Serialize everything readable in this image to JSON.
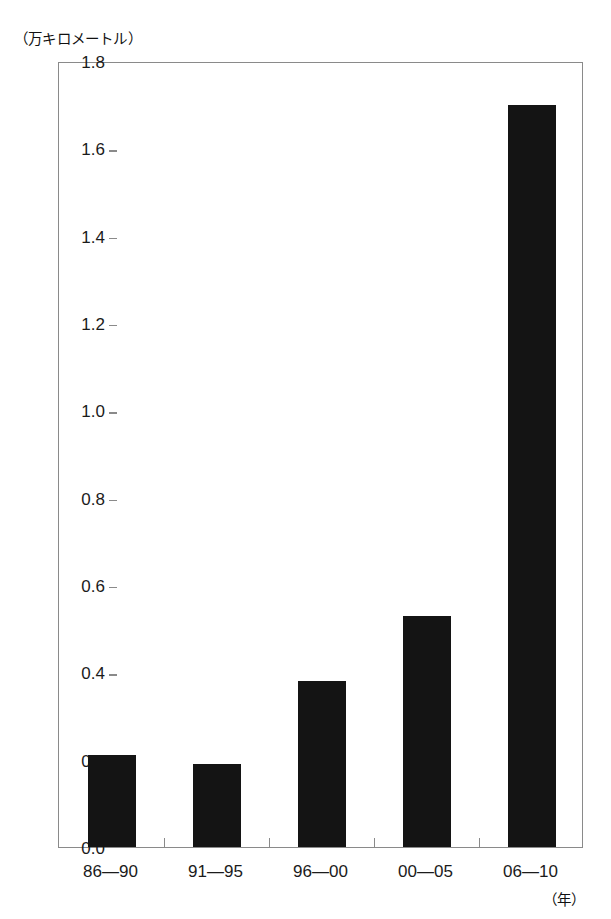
{
  "chart_data": {
    "type": "bar",
    "title": "",
    "subtitle": "",
    "xlabel": "（年）",
    "ylabel": "（万キロメートル）",
    "categories": [
      "86—90",
      "91—95",
      "96—00",
      "00—05",
      "06—10"
    ],
    "values": [
      0.21,
      0.19,
      0.38,
      0.53,
      1.7
    ],
    "ylim": [
      0.0,
      1.8
    ],
    "ytick_step": 0.2,
    "ytick_labels": [
      "1.8",
      "1.6",
      "1.4",
      "1.2",
      "1.0",
      "0.8",
      "0.6",
      "0.4",
      "0.2",
      "0.0"
    ],
    "ytick_values": [
      1.8,
      1.6,
      1.4,
      1.2,
      1.0,
      0.8,
      0.6,
      0.4,
      0.2,
      0.0
    ],
    "grid": false,
    "legend": null,
    "legend_position": "none",
    "bar_color": "#141414",
    "axis_color": "#8a8a8a",
    "series": [
      {
        "name": "",
        "values": [
          0.21,
          0.19,
          0.38,
          0.53,
          1.7
        ]
      }
    ]
  },
  "axes": {
    "y_unit_caption": "（万キロメートル）",
    "x_unit_caption": "（年）"
  }
}
